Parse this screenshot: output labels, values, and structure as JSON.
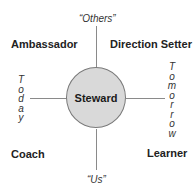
{
  "diagram": {
    "center": {
      "label": "Steward"
    },
    "quadrants": {
      "top_left": "Ambassador",
      "top_right": "Direction Setter",
      "bottom_left": "Coach",
      "bottom_right": "Learner"
    },
    "axes": {
      "top": "“Others”",
      "bottom": "“Us”",
      "left": [
        "T",
        "o",
        "d",
        "a",
        "y"
      ],
      "right": [
        "T",
        "o",
        "m",
        "o",
        "r",
        "r",
        "o",
        "w"
      ]
    },
    "colors": {
      "circle_fill": "#d9d9d9",
      "circle_stroke": "#7a7a7a",
      "axis_line": "#8a8a8a",
      "text": "#222222"
    }
  }
}
